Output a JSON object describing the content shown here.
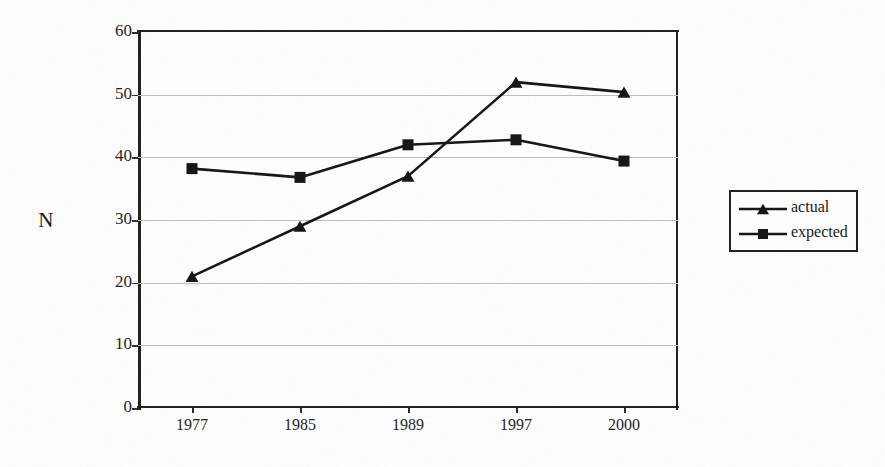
{
  "chart_data": {
    "type": "line",
    "title": "",
    "subtitle": "",
    "xlabel": "",
    "ylabel": "N",
    "categories": [
      "1977",
      "1985",
      "1989",
      "1997",
      "2000"
    ],
    "series": [
      {
        "name": "actual",
        "marker": "triangle",
        "color": "#111111",
        "values": [
          21,
          29,
          37,
          52,
          50.4
        ]
      },
      {
        "name": "expected",
        "marker": "square",
        "color": "#111111",
        "values": [
          38.2,
          36.8,
          42,
          42.8,
          39.4
        ]
      }
    ],
    "ylim": [
      0,
      60
    ],
    "ytick_step": 10,
    "yticks": [
      "60",
      "50",
      "40",
      "30",
      "20",
      "10",
      "0"
    ],
    "ytick_values": [
      60,
      50,
      40,
      30,
      20,
      10,
      0
    ],
    "grid": true,
    "grid_axis": "y",
    "legend_position": "right",
    "legend_entries": [
      "actual",
      "expected"
    ]
  },
  "axes": {
    "y_title": "N"
  },
  "legend": {
    "items": [
      {
        "label": "actual",
        "marker": "triangle-marker-icon"
      },
      {
        "label": "expected",
        "marker": "square-marker-icon"
      }
    ]
  },
  "colors": {
    "ink": "#111111",
    "gridline": "#b9bcc4",
    "paper": "#ffffff"
  }
}
